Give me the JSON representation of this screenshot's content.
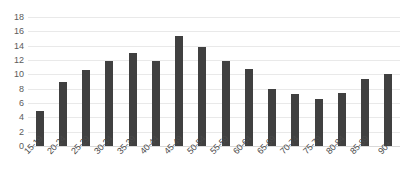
{
  "chart_data": {
    "type": "bar",
    "title": "",
    "subtitle": "",
    "xlabel": "",
    "ylabel": "",
    "categories": [
      "15-19",
      "20-24",
      "25-29",
      "30-34",
      "35-39",
      "40-44",
      "45-49",
      "50-54",
      "55-59",
      "60-64",
      "65-69",
      "70-74",
      "75-79",
      "80-84",
      "85-89",
      "90+"
    ],
    "values": [
      4.9,
      9.0,
      10.6,
      11.9,
      13.0,
      11.9,
      15.4,
      13.8,
      11.8,
      10.7,
      7.9,
      7.2,
      6.5,
      7.4,
      9.3,
      10.1
    ],
    "series": [
      {
        "name": "",
        "values": [
          4.9,
          9.0,
          10.6,
          11.9,
          13.0,
          11.9,
          15.4,
          13.8,
          11.8,
          10.7,
          7.9,
          7.2,
          6.5,
          7.4,
          9.3,
          10.1
        ]
      }
    ],
    "ylim": [
      0,
      18
    ],
    "yticks": [
      0,
      2,
      4,
      6,
      8,
      10,
      12,
      14,
      16,
      18
    ],
    "ytick_labels": [
      "0",
      "2",
      "4",
      "6",
      "8",
      "10",
      "12",
      "14",
      "16",
      "18"
    ],
    "grid": true,
    "grid_axis": "y",
    "legend": false,
    "legend_position": "none",
    "bar_color": "#404040",
    "grid_color": "#e9e9e9",
    "tick_label_color": "#5b5b5b",
    "xtick_rotation": -45,
    "background": "#ffffff",
    "annotations": []
  }
}
